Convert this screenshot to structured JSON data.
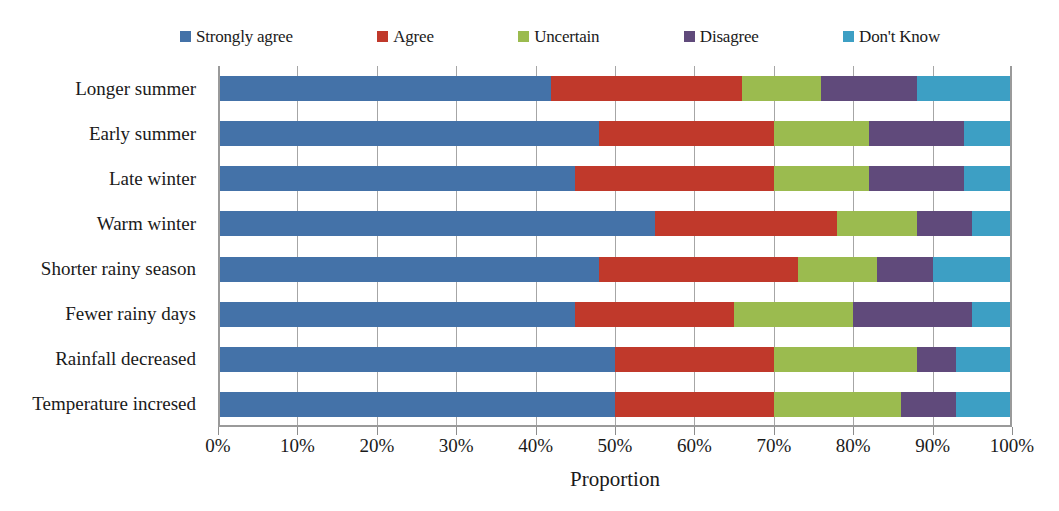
{
  "chart_data": {
    "type": "bar",
    "orientation": "horizontal",
    "stacked": true,
    "normalized": true,
    "title": "",
    "xlabel": "Proportion",
    "ylabel": "",
    "xlim": [
      0,
      100
    ],
    "xunit": "%",
    "xticks": [
      "0%",
      "10%",
      "20%",
      "30%",
      "40%",
      "50%",
      "60%",
      "70%",
      "80%",
      "90%",
      "100%"
    ],
    "xtick_values": [
      0,
      10,
      20,
      30,
      40,
      50,
      60,
      70,
      80,
      90,
      100
    ],
    "grid": true,
    "grid_axis": "x",
    "legend_position": "top",
    "categories": [
      "Longer summer",
      "Early summer",
      "Late winter",
      "Warm winter",
      "Shorter rainy season",
      "Fewer rainy days",
      "Rainfall decreased",
      "Temperature incresed"
    ],
    "series": [
      {
        "name": "Strongly agree",
        "color": "#4472a8",
        "values": [
          42,
          48,
          45,
          55,
          48,
          45,
          50,
          50
        ]
      },
      {
        "name": "Agree",
        "color": "#c0392b",
        "values": [
          24,
          22,
          25,
          23,
          25,
          20,
          20,
          20
        ]
      },
      {
        "name": "Uncertain",
        "color": "#9bbb4f",
        "values": [
          10,
          12,
          12,
          10,
          10,
          15,
          18,
          16
        ]
      },
      {
        "name": "Disagree",
        "color": "#604a7b",
        "values": [
          12,
          12,
          12,
          7,
          7,
          15,
          5,
          7
        ]
      },
      {
        "name": "Don't Know",
        "color": "#3d9fc4",
        "values": [
          12,
          6,
          6,
          5,
          10,
          5,
          7,
          7
        ]
      }
    ]
  },
  "legend": {
    "items": [
      {
        "label": "Strongly agree",
        "color": "#4472a8"
      },
      {
        "label": "Agree",
        "color": "#c0392b"
      },
      {
        "label": "Uncertain",
        "color": "#9bbb4f"
      },
      {
        "label": "Disagree",
        "color": "#604a7b"
      },
      {
        "label": "Don't Know",
        "color": "#3d9fc4"
      }
    ]
  },
  "axis": {
    "x_title": "Proportion"
  }
}
